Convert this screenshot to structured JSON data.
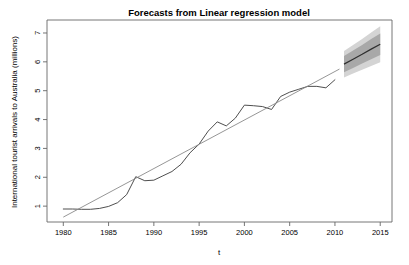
{
  "chart_data": {
    "type": "line",
    "title": "Forecasts from Linear regression model",
    "xlabel": "t",
    "ylabel": "International tourist arrivals to Australia (millions)",
    "xlim": [
      1978.2,
      2016.3
    ],
    "ylim": [
      0.45,
      7.45
    ],
    "grid": false,
    "legend": "none",
    "x_ticks": [
      "1980",
      "1985",
      "1990",
      "1995",
      "2000",
      "2005",
      "2010",
      "2015"
    ],
    "x_tick_values": [
      1980,
      1985,
      1990,
      1995,
      2000,
      2005,
      2010,
      2015
    ],
    "y_ticks": [
      "1",
      "2",
      "3",
      "4",
      "5",
      "6",
      "7"
    ],
    "y_tick_values": [
      1,
      2,
      3,
      4,
      5,
      6,
      7
    ],
    "series": [
      {
        "name": "Observed international tourist arrivals",
        "kind": "line",
        "color": "#3a3a3a",
        "x": [
          1980,
          1981,
          1982,
          1983,
          1984,
          1985,
          1986,
          1987,
          1988,
          1989,
          1990,
          1991,
          1992,
          1993,
          1994,
          1995,
          1996,
          1997,
          1998,
          1999,
          2000,
          2001,
          2002,
          2003,
          2004,
          2005,
          2006,
          2007,
          2008,
          2009,
          2010
        ],
        "values": [
          0.9,
          0.9,
          0.89,
          0.89,
          0.92,
          0.99,
          1.12,
          1.4,
          2.02,
          1.88,
          1.9,
          2.05,
          2.2,
          2.45,
          2.85,
          3.15,
          3.6,
          3.92,
          3.78,
          4.05,
          4.5,
          4.48,
          4.45,
          4.35,
          4.8,
          4.95,
          5.05,
          5.15,
          5.15,
          5.1,
          5.38
        ]
      },
      {
        "name": "Fitted linear regression line",
        "kind": "line",
        "color": "#8a8a8a",
        "x": [
          1980,
          2010.5
        ],
        "values": [
          0.62,
          5.75
        ]
      },
      {
        "name": "Point forecast",
        "kind": "line",
        "color": "#2f2f2f",
        "x": [
          2011,
          2012,
          2013,
          2014,
          2015
        ],
        "values": [
          5.92,
          6.09,
          6.26,
          6.44,
          6.61
        ]
      }
    ],
    "intervals": [
      {
        "name": "95% prediction interval",
        "level": 95,
        "color": "#d4d4d4",
        "x": [
          2011,
          2012,
          2013,
          2014,
          2015
        ],
        "lower": [
          5.46,
          5.6,
          5.73,
          5.86,
          5.99
        ],
        "upper": [
          6.38,
          6.58,
          6.79,
          7.02,
          7.23
        ]
      },
      {
        "name": "80% prediction interval",
        "level": 80,
        "color": "#a8a8a8",
        "x": [
          2011,
          2012,
          2013,
          2014,
          2015
        ],
        "lower": [
          5.64,
          5.79,
          5.94,
          6.09,
          6.24
        ],
        "upper": [
          6.2,
          6.39,
          6.58,
          6.79,
          6.98
        ]
      }
    ]
  }
}
